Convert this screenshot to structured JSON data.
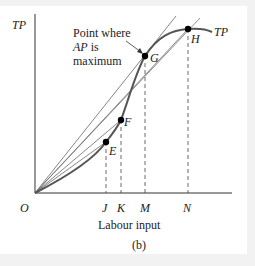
{
  "figure": {
    "y_axis_label": "TP",
    "curve_label": "TP",
    "x_axis_label": "Labour input",
    "caption": "(b)",
    "origin_label": "O",
    "annotation": {
      "line1": "Point where",
      "line2_italic": "AP",
      "line2_rest": " is",
      "line3": "maximum"
    },
    "points": [
      {
        "name": "E",
        "x": 106,
        "y": 142
      },
      {
        "name": "F",
        "x": 121,
        "y": 120
      },
      {
        "name": "G",
        "x": 145,
        "y": 56
      },
      {
        "name": "H",
        "x": 188,
        "y": 29
      }
    ],
    "x_ticks": [
      {
        "label": "J",
        "x": 106
      },
      {
        "label": "K",
        "x": 121
      },
      {
        "label": "M",
        "x": 145
      },
      {
        "label": "N",
        "x": 188
      }
    ],
    "colors": {
      "curve": "#555555",
      "axis": "#333333",
      "ray": "#666666",
      "point": "#000000"
    }
  }
}
